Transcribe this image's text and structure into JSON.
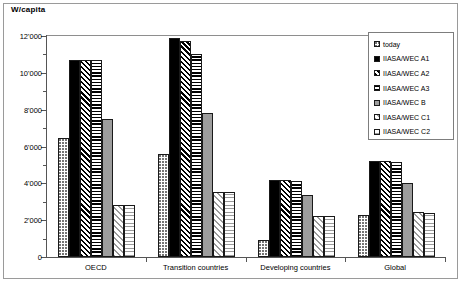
{
  "axis_title": "W/capita",
  "legend": {
    "entries": [
      {
        "label": "today",
        "pattern": "p-dots"
      },
      {
        "label": "IIASA/WEC A1",
        "pattern": "p-solid-black"
      },
      {
        "label": "IIASA/WEC A2",
        "pattern": "p-diag-dark"
      },
      {
        "label": "IIASA/WEC A3",
        "pattern": "p-horiz-dark"
      },
      {
        "label": "IIASA/WEC B",
        "pattern": "p-solid-gray"
      },
      {
        "label": "IIASA/WEC C1",
        "pattern": "p-diag-light"
      },
      {
        "label": "IIASA/WEC C2",
        "pattern": "p-horiz-light"
      }
    ]
  },
  "y_ticks_major": [
    "0",
    "2'000",
    "4'000",
    "6'000",
    "8'000",
    "10'000",
    "12'000"
  ],
  "chart_data": {
    "type": "bar",
    "title": "",
    "xlabel": "",
    "ylabel": "W/capita",
    "ylim": [
      0,
      12000
    ],
    "ytick_values": [
      0,
      2000,
      4000,
      6000,
      8000,
      10000,
      12000
    ],
    "yminor_step": 1000,
    "grid": false,
    "legend_position": "top-right",
    "categories": [
      "OECD",
      "Transition countries",
      "Developing countries",
      "Global"
    ],
    "series": [
      {
        "name": "today",
        "pattern": "p-dots",
        "values": [
          6450,
          5600,
          950,
          2300
        ]
      },
      {
        "name": "IIASA/WEC A1",
        "pattern": "p-solid-black",
        "values": [
          10700,
          11900,
          4200,
          5200
        ]
      },
      {
        "name": "IIASA/WEC A2",
        "pattern": "p-diag-dark",
        "values": [
          10700,
          11750,
          4200,
          5200
        ]
      },
      {
        "name": "IIASA/WEC A3",
        "pattern": "p-horiz-dark",
        "values": [
          10700,
          11000,
          4150,
          5150
        ]
      },
      {
        "name": "IIASA/WEC B",
        "pattern": "p-solid-gray",
        "values": [
          7500,
          7800,
          3350,
          4000
        ]
      },
      {
        "name": "IIASA/WEC C1",
        "pattern": "p-diag-light",
        "values": [
          2850,
          3550,
          2250,
          2450
        ]
      },
      {
        "name": "IIASA/WEC C2",
        "pattern": "p-horiz-light",
        "values": [
          2800,
          3550,
          2200,
          2400
        ]
      }
    ]
  }
}
